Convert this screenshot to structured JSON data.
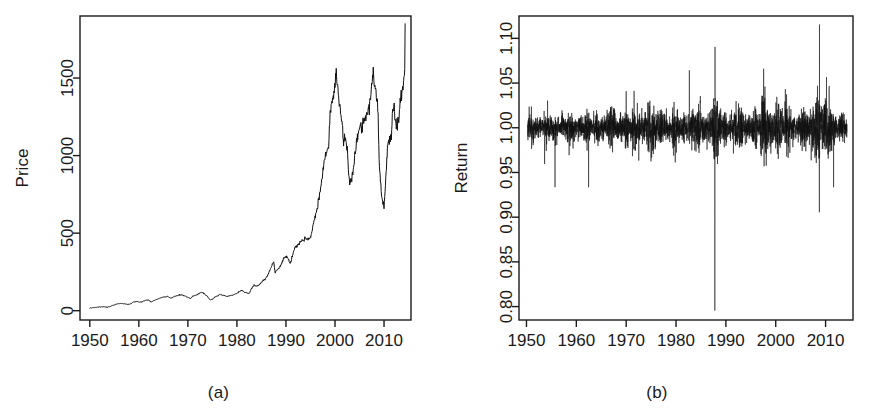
{
  "figure": {
    "title": "",
    "background_color": "#ffffff",
    "ink_color": "#1a1a1a",
    "panel_a_caption": "(a)",
    "panel_b_caption": "(b)"
  },
  "chart_data": [
    {
      "id": "panel-a",
      "type": "line",
      "title": "",
      "caption": "(a)",
      "xlabel": "",
      "ylabel": "Price",
      "xlim": [
        1948.0,
        2015.5
      ],
      "ylim": [
        -60,
        1900
      ],
      "xticks": [
        1950,
        1960,
        1970,
        1980,
        1990,
        2000,
        2010
      ],
      "xtick_labels": [
        "1950",
        "1960",
        "1970",
        "1980",
        "1990",
        "2000",
        "2010"
      ],
      "yticks": [
        0,
        500,
        1000,
        1500
      ],
      "ytick_labels": [
        "0",
        "500",
        "1000",
        "1500"
      ],
      "grid": false,
      "legend": false,
      "series": [
        {
          "name": "Price",
          "x": [
            1950.0,
            1950.5,
            1951.0,
            1951.5,
            1952.0,
            1952.5,
            1953.0,
            1953.5,
            1954.0,
            1954.5,
            1955.0,
            1955.5,
            1956.0,
            1956.5,
            1957.0,
            1957.5,
            1958.0,
            1958.5,
            1959.0,
            1959.5,
            1960.0,
            1960.5,
            1961.0,
            1961.5,
            1962.0,
            1962.5,
            1963.0,
            1963.5,
            1964.0,
            1964.5,
            1965.0,
            1965.5,
            1966.0,
            1966.5,
            1967.0,
            1967.5,
            1968.0,
            1968.5,
            1969.0,
            1969.5,
            1970.0,
            1970.5,
            1971.0,
            1971.5,
            1972.0,
            1972.5,
            1973.0,
            1973.5,
            1974.0,
            1974.5,
            1975.0,
            1975.5,
            1976.0,
            1976.5,
            1977.0,
            1977.5,
            1978.0,
            1978.5,
            1979.0,
            1979.5,
            1980.0,
            1980.5,
            1981.0,
            1981.5,
            1982.0,
            1982.5,
            1983.0,
            1983.5,
            1984.0,
            1984.5,
            1985.0,
            1985.5,
            1986.0,
            1986.5,
            1987.0,
            1987.5,
            1987.8,
            1988.0,
            1988.5,
            1989.0,
            1989.5,
            1990.0,
            1990.5,
            1990.8,
            1991.0,
            1991.5,
            1992.0,
            1992.5,
            1993.0,
            1993.5,
            1994.0,
            1994.5,
            1995.0,
            1995.5,
            1996.0,
            1996.5,
            1997.0,
            1997.5,
            1998.0,
            1998.5,
            1998.7,
            1999.0,
            1999.5,
            2000.0,
            2000.25,
            2000.6,
            2001.0,
            2001.5,
            2001.75,
            2002.0,
            2002.5,
            2002.8,
            2003.0,
            2003.5,
            2004.0,
            2004.5,
            2005.0,
            2005.5,
            2006.0,
            2006.5,
            2007.0,
            2007.4,
            2007.8,
            2008.0,
            2008.5,
            2008.8,
            2009.0,
            2009.2,
            2009.5,
            2010.0,
            2010.5,
            2010.7,
            2011.0,
            2011.5,
            2011.75,
            2012.0,
            2012.5,
            2013.0,
            2013.5,
            2014.0,
            2014.3
          ],
          "y": [
            17,
            19,
            21,
            22,
            24,
            25,
            25,
            23,
            26,
            32,
            37,
            43,
            45,
            47,
            45,
            42,
            41,
            48,
            56,
            59,
            56,
            55,
            62,
            68,
            69,
            56,
            64,
            71,
            77,
            84,
            87,
            89,
            92,
            80,
            87,
            95,
            98,
            102,
            101,
            93,
            86,
            78,
            93,
            99,
            104,
            115,
            118,
            104,
            92,
            70,
            73,
            89,
            95,
            104,
            100,
            98,
            92,
            96,
            99,
            104,
            112,
            124,
            132,
            118,
            115,
            110,
            145,
            163,
            160,
            166,
            180,
            198,
            212,
            245,
            280,
            318,
            245,
            258,
            270,
            295,
            340,
            350,
            330,
            305,
            322,
            375,
            410,
            425,
            440,
            455,
            465,
            462,
            470,
            545,
            610,
            685,
            760,
            885,
            980,
            1050,
            1040,
            1280,
            1350,
            1450,
            1520,
            1440,
            1310,
            1200,
            1070,
            1140,
            1050,
            880,
            815,
            860,
            990,
            1120,
            1180,
            1200,
            1230,
            1270,
            1310,
            1420,
            1540,
            1480,
            1380,
            1280,
            970,
            870,
            735,
            680,
            920,
            1070,
            1090,
            1130,
            1280,
            1320,
            1180,
            1240,
            1380,
            1460,
            1600,
            1790,
            1850
          ]
        }
      ]
    },
    {
      "id": "panel-b",
      "type": "line",
      "title": "",
      "caption": "(b)",
      "xlabel": "",
      "ylabel": "Return",
      "xlim": [
        1948.5,
        2015.5
      ],
      "ylim": [
        0.785,
        1.125
      ],
      "xticks": [
        1950,
        1960,
        1970,
        1980,
        1990,
        2000,
        2010
      ],
      "xtick_labels": [
        "1950",
        "1960",
        "1970",
        "1980",
        "1990",
        "2000",
        "2010"
      ],
      "yticks": [
        0.8,
        0.85,
        0.9,
        0.95,
        1.0,
        1.05,
        1.1
      ],
      "ytick_labels": [
        "0.80",
        "0.85",
        "0.90",
        "0.95",
        "1.00",
        "1.05",
        "1.10"
      ],
      "grid": false,
      "legend": false,
      "description": "Daily gross returns (price relative) of the index, centred on 1.00, plotted as a dense high-frequency spike series from 1950 to 2014.",
      "series": [
        {
          "name": "Return",
          "center": 1.0,
          "x_start": 1950.2,
          "x_end": 2014.3,
          "n_points": 3400,
          "baseline_volatility": 0.0072,
          "notable_events": [
            {
              "x": 1987.79,
              "y": 0.7955,
              "label": "Black Monday crash"
            },
            {
              "x": 1987.83,
              "y": 1.0905,
              "label": "post-crash rebound"
            },
            {
              "x": 2008.78,
              "y": 1.1155,
              "label": "October 2008 rebound"
            },
            {
              "x": 2008.75,
              "y": 0.9055,
              "label": "October 2008 selloff"
            },
            {
              "x": 1955.72,
              "y": 0.9335,
              "label": "Eisenhower heart attack"
            },
            {
              "x": 1962.45,
              "y": 0.9335,
              "label": "1962 Kennedy slide"
            },
            {
              "x": 2011.6,
              "y": 0.9335,
              "label": "August 2011 downgrade"
            }
          ],
          "volatility_regimes": [
            {
              "x_start": 1950.2,
              "x_end": 1962.0,
              "sigma": 0.0058
            },
            {
              "x_start": 1962.0,
              "x_end": 1966.0,
              "sigma": 0.0062
            },
            {
              "x_start": 1966.0,
              "x_end": 1974.0,
              "sigma": 0.0074
            },
            {
              "x_start": 1974.0,
              "x_end": 1976.0,
              "sigma": 0.0104
            },
            {
              "x_start": 1976.0,
              "x_end": 1982.0,
              "sigma": 0.0078
            },
            {
              "x_start": 1982.0,
              "x_end": 1987.5,
              "sigma": 0.0088
            },
            {
              "x_start": 1987.5,
              "x_end": 1989.0,
              "sigma": 0.0128
            },
            {
              "x_start": 1989.0,
              "x_end": 1997.0,
              "sigma": 0.0072
            },
            {
              "x_start": 1997.0,
              "x_end": 2003.2,
              "sigma": 0.0122
            },
            {
              "x_start": 2003.2,
              "x_end": 2007.3,
              "sigma": 0.0066
            },
            {
              "x_start": 2007.3,
              "x_end": 2010.0,
              "sigma": 0.0158
            },
            {
              "x_start": 2010.0,
              "x_end": 2012.2,
              "sigma": 0.0108
            },
            {
              "x_start": 2012.2,
              "x_end": 2014.3,
              "sigma": 0.0068
            }
          ]
        }
      ]
    }
  ]
}
